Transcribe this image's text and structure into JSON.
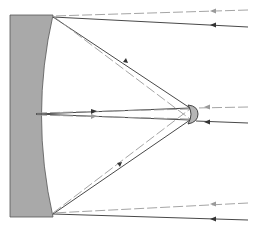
{
  "diagram": {
    "colors": {
      "primary_mirror_fill": "#a9a9a9",
      "mirror_outline": "#555555",
      "solid_ray": "#333333",
      "dashed_ray": "#9a9a9a",
      "secondary_fill": "#b5b5b5"
    },
    "elements": [
      "primary-mirror",
      "secondary-mirror",
      "incoming-rays",
      "reflected-rays"
    ]
  }
}
